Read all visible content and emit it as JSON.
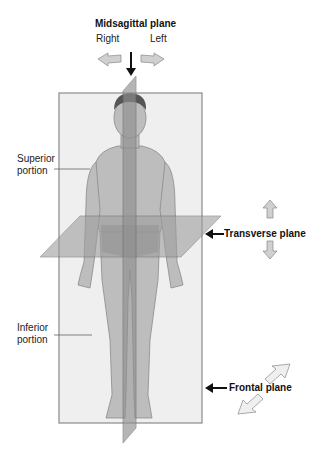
{
  "diagram": {
    "midsagittal": {
      "label": "Midsagittal plane",
      "left_dir": "Right",
      "right_dir": "Left"
    },
    "transverse": {
      "label": "Transverse plane"
    },
    "frontal": {
      "label": "Frontal plane"
    },
    "superior": {
      "line1": "Superior",
      "line2": "portion"
    },
    "inferior": {
      "line1": "Inferior",
      "line2": "portion"
    },
    "colors": {
      "plane_fill": "#ececec",
      "plane_edge": "#8a8a8a",
      "skin": "#b8b8b8",
      "sagittal": "#9a9a9a",
      "transverse": "#a6a6a6",
      "hair": "#555555",
      "arrow": "#c8c8c8"
    }
  }
}
